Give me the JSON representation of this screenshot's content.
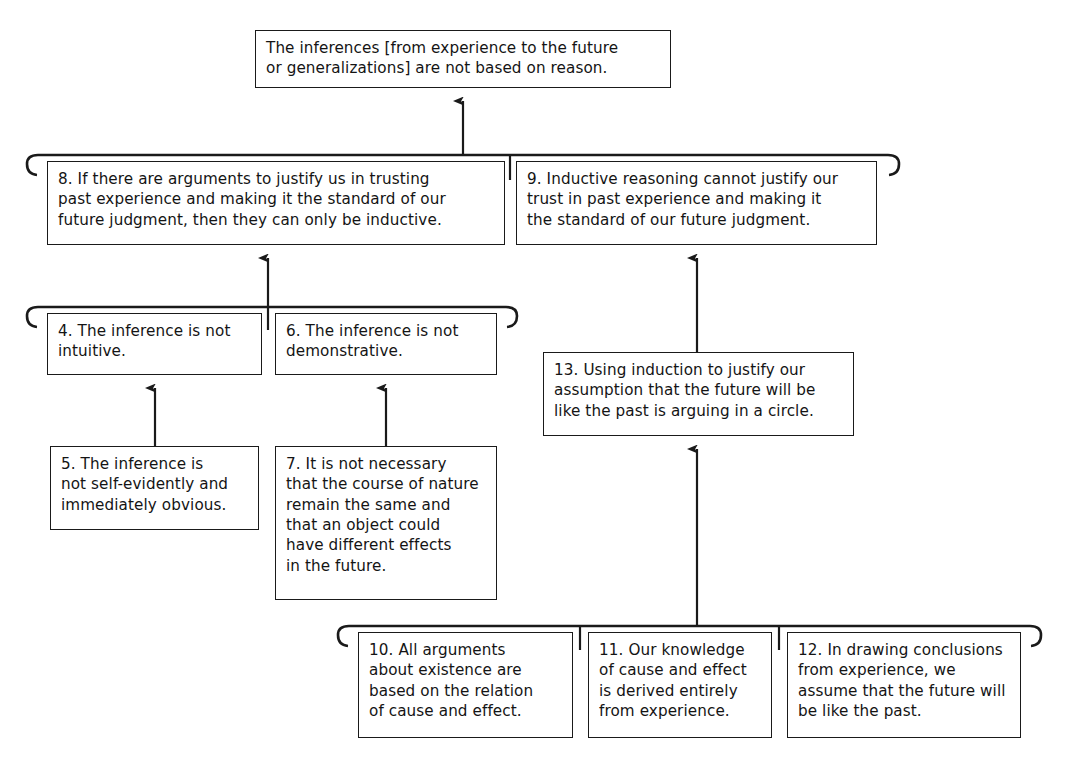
{
  "diagram": {
    "type": "argument-map",
    "stroke_color": "#1a1a1a",
    "text_color": "#141414",
    "background": "#ffffff",
    "nodes": [
      {
        "id": "conclusion",
        "number": "",
        "label": "The inferences [from experience to the future\nor generalizations] are not based on reason.",
        "x": 255,
        "y": 30,
        "w": 416,
        "h": 58
      },
      {
        "id": "n8",
        "number": "8",
        "label": "8. If there are arguments to justify us in trusting\npast experience and making it the standard of our\nfuture judgment, then they can only be inductive.",
        "x": 47,
        "y": 161,
        "w": 458,
        "h": 84
      },
      {
        "id": "n9",
        "number": "9",
        "label": "9. Inductive reasoning cannot justify our\ntrust in past experience and making it\nthe standard of our future judgment.",
        "x": 516,
        "y": 161,
        "w": 361,
        "h": 84
      },
      {
        "id": "n4",
        "number": "4",
        "label": "4. The inference is not\nintuitive.",
        "x": 47,
        "y": 313,
        "w": 215,
        "h": 62
      },
      {
        "id": "n6",
        "number": "6",
        "label": "6. The inference is not\ndemonstrative.",
        "x": 275,
        "y": 313,
        "w": 222,
        "h": 62
      },
      {
        "id": "n13",
        "number": "13",
        "label": "13. Using induction to justify our\nassumption that the future will be\nlike the past is arguing in a circle.",
        "x": 543,
        "y": 352,
        "w": 311,
        "h": 84
      },
      {
        "id": "n5",
        "number": "5",
        "label": "5. The inference is\nnot self-evidently and\nimmediately obvious.",
        "x": 50,
        "y": 446,
        "w": 209,
        "h": 84
      },
      {
        "id": "n7",
        "number": "7",
        "label": "7. It is not necessary\nthat the course of nature\nremain the same and\nthat an object could\nhave different effects\nin the future.",
        "x": 275,
        "y": 446,
        "w": 222,
        "h": 154
      },
      {
        "id": "n10",
        "number": "10",
        "label": "10. All arguments\nabout existence are\nbased on the relation\nof cause and effect.",
        "x": 358,
        "y": 632,
        "w": 215,
        "h": 106
      },
      {
        "id": "n11",
        "number": "11",
        "label": "11. Our knowledge\nof cause and effect\nis derived entirely\nfrom experience.",
        "x": 588,
        "y": 632,
        "w": 184,
        "h": 106
      },
      {
        "id": "n12",
        "number": "12",
        "label": "12. In drawing conclusions\nfrom experience, we\nassume that the future will\nbe like the past.",
        "x": 787,
        "y": 632,
        "w": 234,
        "h": 106
      }
    ],
    "brackets": [
      {
        "id": "bracket-8-9",
        "members": [
          "n8",
          "n9"
        ],
        "x1": 36,
        "x2": 890,
        "y": 155,
        "stub_x": 510,
        "stub_bottom": 180
      },
      {
        "id": "bracket-4-6",
        "members": [
          "n4",
          "n6"
        ],
        "x1": 36,
        "x2": 508,
        "y": 307,
        "stub_x": 268,
        "stub_bottom": 330
      },
      {
        "id": "bracket-10-11-12",
        "members": [
          "n10",
          "n11",
          "n12"
        ],
        "x1": 347,
        "x2": 1032,
        "y": 626,
        "stub_x": 580,
        "stub_x2": 779,
        "stub_bottom": 650
      }
    ],
    "arrows": [
      {
        "id": "arrow-bracket89-to-conclusion",
        "from": "bracket-8-9",
        "to": "conclusion",
        "x": 463,
        "y1": 155,
        "y2": 90
      },
      {
        "id": "arrow-bracket46-to-8",
        "from": "bracket-4-6",
        "to": "n8",
        "x": 268,
        "y1": 307,
        "y2": 247
      },
      {
        "id": "arrow-5-to-4",
        "from": "n5",
        "to": "n4",
        "x": 155,
        "y1": 446,
        "y2": 377
      },
      {
        "id": "arrow-7-to-6",
        "from": "n7",
        "to": "n6",
        "x": 386,
        "y1": 446,
        "y2": 377
      },
      {
        "id": "arrow-13-to-9",
        "from": "n13",
        "to": "n9",
        "x": 697,
        "y1": 352,
        "y2": 247
      },
      {
        "id": "arrow-bracket101112-to-13",
        "from": "bracket-10-11-12",
        "to": "n13",
        "x": 697,
        "y1": 626,
        "y2": 438
      }
    ]
  }
}
